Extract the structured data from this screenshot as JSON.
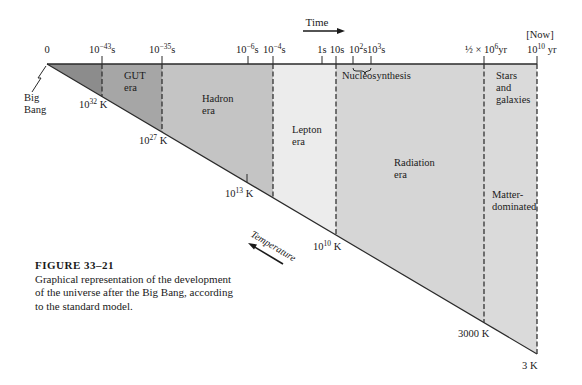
{
  "diagram": {
    "time_label": "Time",
    "now_label": "[Now]",
    "time_ticks": [
      {
        "label": "0",
        "sup": "",
        "unit": ""
      },
      {
        "label": "10",
        "sup": "−43",
        "unit": "s"
      },
      {
        "label": "10",
        "sup": "−35",
        "unit": "s"
      },
      {
        "label": "10",
        "sup": "−6",
        "unit": "s"
      },
      {
        "label": "10",
        "sup": "−4",
        "unit": "s"
      },
      {
        "label": "1s",
        "sup": "",
        "unit": ""
      },
      {
        "label": "10s",
        "sup": "",
        "unit": ""
      },
      {
        "label": "10",
        "sup": "2",
        "unit": "s"
      },
      {
        "label": "10",
        "sup": "3",
        "unit": "s"
      },
      {
        "label": "½ × 10",
        "sup": "6",
        "unit": "yr"
      },
      {
        "label": "10",
        "sup": "10",
        "unit": " yr"
      }
    ],
    "big_bang_label_1": "Big",
    "big_bang_label_2": "Bang",
    "eras": {
      "gut_1": "GUT",
      "gut_2": "era",
      "hadron_1": "Hadron",
      "hadron_2": "era",
      "lepton_1": "Lepton",
      "lepton_2": "era",
      "nucleosynthesis": "Nucleosynthesis",
      "radiation_1": "Radiation",
      "radiation_2": "era",
      "stars_1": "Stars",
      "stars_2": "and",
      "stars_3": "galaxies",
      "matter_1": "Matter-",
      "matter_2": "dominated"
    },
    "temperatures": [
      {
        "base": "10",
        "sup": "32",
        "unit": " K"
      },
      {
        "base": "10",
        "sup": "27",
        "unit": " K"
      },
      {
        "base": "10",
        "sup": "13",
        "unit": " K"
      },
      {
        "base": "10",
        "sup": "10",
        "unit": " K"
      },
      {
        "base": "3000 K",
        "sup": "",
        "unit": ""
      },
      {
        "base": "3 K",
        "sup": "",
        "unit": ""
      }
    ],
    "temperature_label": "Temperature",
    "colors": {
      "planck": "#8c8c8c",
      "gut": "#a6a6a6",
      "hadron": "#c4c4c4",
      "lepton": "#ececec",
      "radiation": "#d6d6d6",
      "matter": "#dadada",
      "line": "#2a2a2a"
    }
  },
  "caption": {
    "figure": "FIGURE 33–21",
    "text": "Graphical representation of the development of the universe after the Big Bang, according to the standard model."
  }
}
